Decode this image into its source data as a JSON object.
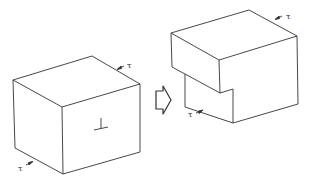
{
  "figure": {
    "left_block": {
      "state": "before",
      "symbol": "⊥",
      "stress_labels": [
        "τ",
        "τ"
      ]
    },
    "transition_arrow": {
      "icon": "hollow-right-arrow-icon"
    },
    "right_block": {
      "state": "after",
      "stress_labels": [
        "τ",
        "τ"
      ]
    },
    "colors": {
      "line": "#333333",
      "background": "#ffffff"
    }
  }
}
